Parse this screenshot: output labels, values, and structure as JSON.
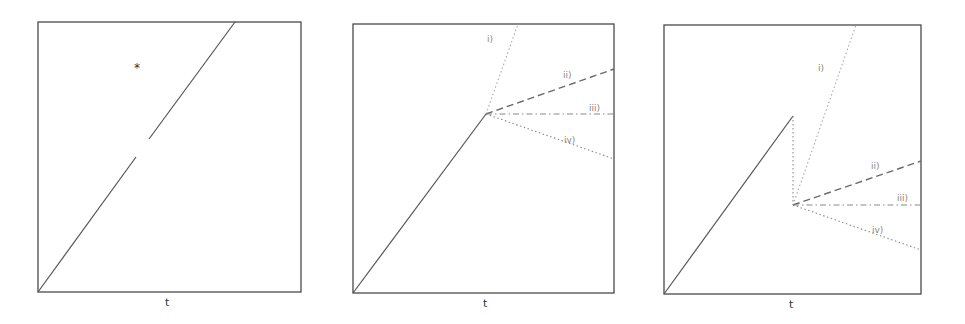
{
  "figure": {
    "panels": [
      {
        "id": "panel-1",
        "xlabel": "t",
        "marker": "*",
        "description": "Single trajectory (solid line) from origin with a gap; isolated point marked with a star"
      },
      {
        "id": "panel-2",
        "xlabel": "t",
        "description": "Solid trajectory up to a branching point, then four possible continuations",
        "branches": [
          {
            "label": "i)",
            "style": "dotted"
          },
          {
            "label": "ii)",
            "style": "dashed"
          },
          {
            "label": "iii)",
            "style": "dash-dot"
          },
          {
            "label": "iv)",
            "style": "dotted"
          }
        ]
      },
      {
        "id": "panel-3",
        "xlabel": "t",
        "description": "Solid trajectory, then a vertical drop (dotted), followed by four possible continuations from the lower point",
        "branches": [
          {
            "label": "i)",
            "style": "dotted"
          },
          {
            "label": "ii)",
            "style": "dashed"
          },
          {
            "label": "iii)",
            "style": "dash-dot"
          },
          {
            "label": "iv)",
            "style": "dotted"
          }
        ]
      }
    ],
    "colors": {
      "frame": "#4a4a4a",
      "solid_line": "#555555",
      "branch_line": "#8a8a8a",
      "label_text": "#888888"
    }
  }
}
